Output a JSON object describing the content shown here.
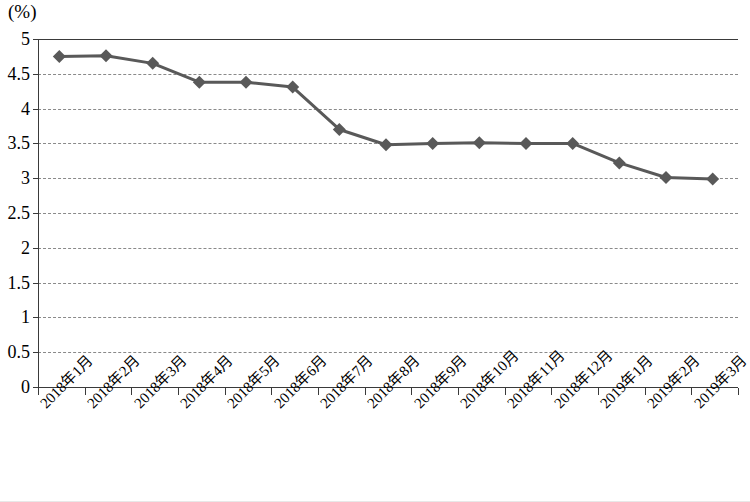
{
  "chart_data": {
    "type": "line",
    "title": "",
    "subtitle": "",
    "unit_label": "(%)",
    "xlabel": "",
    "ylabel": "",
    "ylim": [
      0,
      5
    ],
    "ytick_step": 0.5,
    "grid": true,
    "legend": "none",
    "marker": "diamond",
    "line_color": "#595959",
    "marker_color": "#595959",
    "gridline_color": "#8a8a8a",
    "axis_color": "#3a3a3a",
    "categories": [
      "2018年1月",
      "2018年2月",
      "2018年3月",
      "2018年4月",
      "2018年5月",
      "2018年6月",
      "2018年7月",
      "2018年8月",
      "2018年9月",
      "2018年10月",
      "2018年11月",
      "2018年12月",
      "2019年1月",
      "2019年2月",
      "2019年3月"
    ],
    "values": [
      4.75,
      4.76,
      4.65,
      4.38,
      4.38,
      4.31,
      3.7,
      3.48,
      3.5,
      3.51,
      3.5,
      3.5,
      3.22,
      3.01,
      2.99
    ],
    "yticks": [
      "0",
      "0.5",
      "1",
      "1.5",
      "2",
      "2.5",
      "3",
      "3.5",
      "4",
      "4.5",
      "5"
    ],
    "ytick_values": [
      0,
      0.5,
      1,
      1.5,
      2,
      2.5,
      3,
      3.5,
      4,
      4.5,
      5
    ]
  }
}
